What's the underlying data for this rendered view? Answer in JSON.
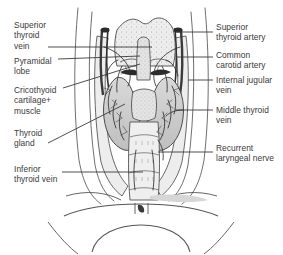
{
  "figure": {
    "background_color": "#ffffff",
    "ink_color": "#3a3a3a",
    "leader_color": "#3b3b3b",
    "width": 283,
    "height": 255
  },
  "labels": {
    "left": [
      {
        "id": "superior-thyroid-vein",
        "text": "Superior\nthyroid\nvein",
        "x": 14,
        "y": 20,
        "leader": {
          "x1": 48,
          "y1": 47,
          "x2": 152,
          "y2": 47
        }
      },
      {
        "id": "pyramidal-lobe",
        "text": "Pyramidal\nlobe",
        "x": 14,
        "y": 56,
        "leader": {
          "x1": 58,
          "y1": 59,
          "x2": 140,
          "y2": 56
        }
      },
      {
        "id": "cricothyoid-cartilage-muscle",
        "text": "Cricothyoid\ncartilage+\nmuscle",
        "x": 14,
        "y": 85,
        "leader": {
          "x1": 63,
          "y1": 88,
          "x2": 140,
          "y2": 64
        }
      },
      {
        "id": "thyroid-gland",
        "text": "Thyroid\ngland",
        "x": 14,
        "y": 128,
        "leader": {
          "x1": 48,
          "y1": 143,
          "x2": 125,
          "y2": 104
        }
      },
      {
        "id": "inferior-thyroid-vein",
        "text": "Inferior\nthyroid vein",
        "x": 14,
        "y": 164,
        "leader": {
          "x1": 62,
          "y1": 172,
          "x2": 143,
          "y2": 172
        }
      }
    ],
    "right": [
      {
        "id": "superior-thyroid-artery",
        "text": "Superior\nthyroid artery",
        "x": 216,
        "y": 22,
        "leader": {
          "x1": 204,
          "y1": 32,
          "x2": 176,
          "y2": 32
        }
      },
      {
        "id": "common-carotid-artery",
        "text": "Common\ncarotid artery",
        "x": 216,
        "y": 50,
        "leader": {
          "x1": 204,
          "y1": 57,
          "x2": 176,
          "y2": 57
        }
      },
      {
        "id": "internal-jugular-vein",
        "text": "Internal jugular\nvein",
        "x": 216,
        "y": 75,
        "leader": {
          "x1": 204,
          "y1": 80,
          "x2": 186,
          "y2": 80
        }
      },
      {
        "id": "middle-thyroid-vein",
        "text": "Middle thyroid\nvein",
        "x": 216,
        "y": 105,
        "leader": {
          "x1": 204,
          "y1": 110,
          "x2": 175,
          "y2": 110
        }
      },
      {
        "id": "recurrent-laryngeal-nerve",
        "text": "Recurrent\nlaryngeal nerve",
        "x": 216,
        "y": 143,
        "leader": {
          "x1": 204,
          "y1": 152,
          "x2": 155,
          "y2": 152
        }
      }
    ]
  },
  "structures": [
    {
      "id": "thyroid-cartilage",
      "name": "Thyroid cartilage (laryngeal prominence)"
    },
    {
      "id": "pyramidal-lobe-shape",
      "name": "Pyramidal lobe"
    },
    {
      "id": "thyroid-right-lobe",
      "name": "Right lobe of thyroid gland"
    },
    {
      "id": "thyroid-left-lobe",
      "name": "Left lobe of thyroid gland"
    },
    {
      "id": "thyroid-isthmus",
      "name": "Isthmus of thyroid gland"
    },
    {
      "id": "trachea",
      "name": "Trachea with cartilage rings"
    },
    {
      "id": "carotid-sheath-left",
      "name": "Left carotid sheath vessels"
    },
    {
      "id": "carotid-sheath-right",
      "name": "Right carotid sheath vessels"
    },
    {
      "id": "sternocleidomastoid-left",
      "name": "Left sternocleidomastoid border"
    },
    {
      "id": "sternocleidomastoid-right",
      "name": "Right sternocleidomastoid border"
    },
    {
      "id": "clavicle-sternum",
      "name": "Clavicles and manubrium of sternum"
    }
  ]
}
